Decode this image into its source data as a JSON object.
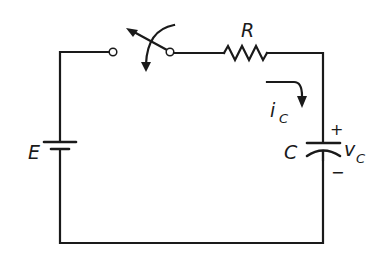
{
  "diagram": {
    "type": "RC charging circuit",
    "labels": {
      "source": "E",
      "resistor": "R",
      "capacitor": "C",
      "current_main": "i",
      "current_sub": "C",
      "voltage_main": "v",
      "voltage_sub": "C",
      "plus": "+",
      "minus": "−"
    },
    "components": [
      {
        "id": "battery",
        "label": "E"
      },
      {
        "id": "switch",
        "state": "closing (arrow indicates throw)"
      },
      {
        "id": "resistor",
        "label": "R"
      },
      {
        "id": "capacitor",
        "label": "C"
      }
    ],
    "colors": {
      "line": "#1a1a1a",
      "background": "#ffffff"
    }
  }
}
